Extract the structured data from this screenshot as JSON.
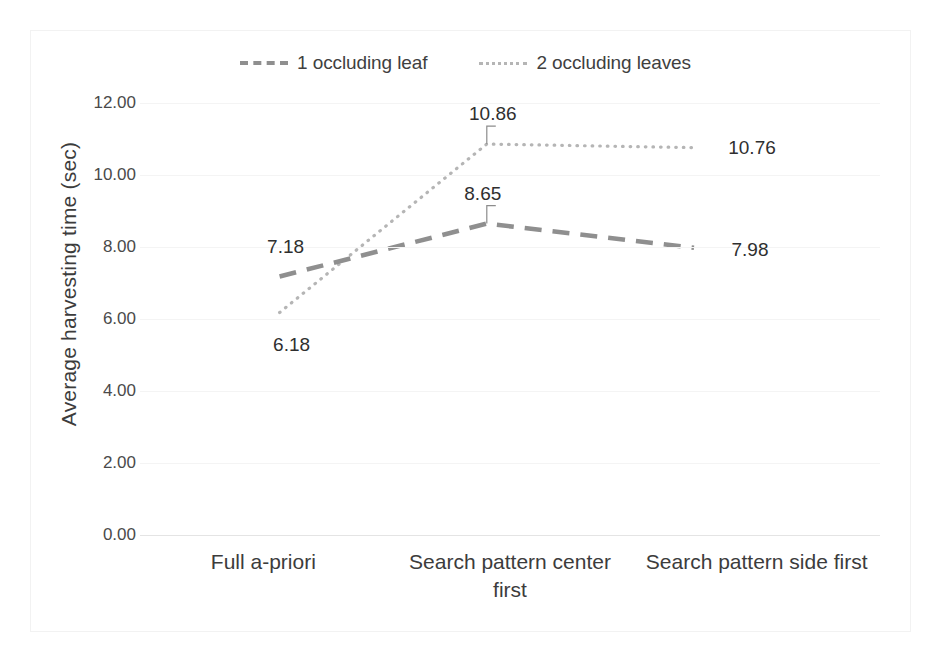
{
  "chart_data": {
    "type": "line",
    "title": "",
    "xlabel": "",
    "ylabel": "Average harvesting time (sec)",
    "categories": [
      "Full a-priori",
      "Search pattern center first",
      "Search pattern side first"
    ],
    "series": [
      {
        "name": "1 occluding leaf",
        "style": "dashed",
        "color": "#8f8f8f",
        "values": [
          7.18,
          8.65,
          7.98
        ],
        "labels": [
          "7.18",
          "8.65",
          "7.98"
        ]
      },
      {
        "name": "2 occluding leaves",
        "style": "dotted",
        "color": "#b5b5b5",
        "values": [
          6.18,
          10.86,
          10.76
        ],
        "labels": [
          "6.18",
          "10.86",
          "10.76"
        ]
      }
    ],
    "ylim": [
      0,
      12
    ],
    "ytick_values": [
      12,
      10,
      8,
      6,
      4,
      2,
      0
    ],
    "ytick_labels": [
      "12.00",
      "10.00",
      "8.00",
      "6.00",
      "4.00",
      "2.00",
      "0.00"
    ],
    "grid": true,
    "legend_position": "top"
  },
  "legend": {
    "entries": [
      {
        "label": "1 occluding leaf",
        "key": "dashed-line-key"
      },
      {
        "label": "2 occluding leaves",
        "key": "dotted-line-key"
      }
    ]
  },
  "axes": {
    "y_title": "Average harvesting time (sec)",
    "y_ticks": [
      "12.00",
      "10.00",
      "8.00",
      "6.00",
      "4.00",
      "2.00",
      "0.00"
    ],
    "x_categories": [
      "Full a-priori",
      "Search pattern center first",
      "Search pattern side first"
    ]
  },
  "data_labels": {
    "s1_c1": "7.18",
    "s1_c2": "8.65",
    "s1_c3": "7.98",
    "s2_c1": "6.18",
    "s2_c2": "10.86",
    "s2_c3": "10.76"
  },
  "colors": {
    "series1": "#8f8f8f",
    "series2": "#b5b5b5",
    "gridline": "#f4f4f4",
    "text": "#3c3c3c",
    "frame": "#f2f2f2"
  }
}
